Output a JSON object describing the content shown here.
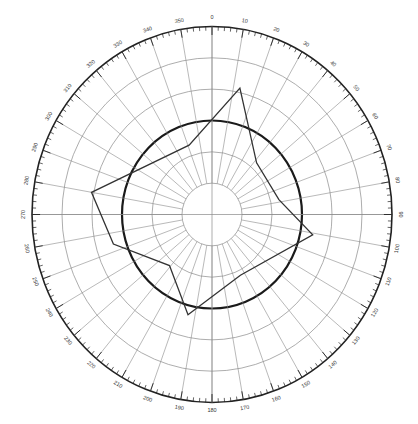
{
  "chart_data": {
    "type": "radar",
    "title": "",
    "angular_axis": {
      "direction": "clockwise",
      "zero_at": "top",
      "tick_labels": [
        "0",
        "10",
        "20",
        "30",
        "40",
        "50",
        "60",
        "70",
        "80",
        "90",
        "100",
        "110",
        "120",
        "130",
        "140",
        "150",
        "160",
        "170",
        "180",
        "190",
        "200",
        "210",
        "220",
        "230",
        "240",
        "250",
        "260",
        "270",
        "280",
        "290",
        "300",
        "310",
        "320",
        "330",
        "340",
        "350"
      ],
      "tick_step_deg": 10,
      "minor_tick_step_deg": 2
    },
    "radial_axis": {
      "range": [
        0,
        1
      ],
      "rings": [
        0.1667,
        0.3333,
        0.5,
        0.6667,
        0.8333,
        1.0
      ],
      "emphasized_ring": 0.5,
      "tick_labels_visible": false
    },
    "series": [
      {
        "name": "pattern",
        "color": "#333333",
        "points": [
          {
            "angle": 13,
            "r": 0.69
          },
          {
            "angle": 42,
            "r": 0.37
          },
          {
            "angle": 78,
            "r": 0.38
          },
          {
            "angle": 101,
            "r": 0.57
          },
          {
            "angle": 154,
            "r": 0.36
          },
          {
            "angle": 194,
            "r": 0.55
          },
          {
            "angle": 221,
            "r": 0.36
          },
          {
            "angle": 254,
            "r": 0.57
          },
          {
            "angle": 280,
            "r": 0.68
          },
          {
            "angle": 341,
            "r": 0.39
          }
        ]
      }
    ],
    "grid": true,
    "legend": null
  },
  "layout": {
    "cx": 212,
    "cy": 214.5,
    "rx": 180,
    "ry": 188,
    "inner_ring": 0.1667
  },
  "colors": {
    "grid": "#8a8a8a",
    "rim": "#222222",
    "bold_ring": "#1a1a1a",
    "series": "#333333"
  }
}
